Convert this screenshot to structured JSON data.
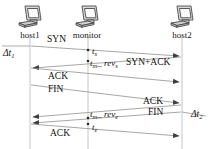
{
  "diagram": {
    "type": "network-sequence-diagram",
    "background_color": "#ffffff",
    "line_color": "#8a8a8a",
    "text_color": "#111111",
    "width": 215,
    "height": 149,
    "nodes": [
      {
        "id": "host1",
        "label": "host1",
        "icon": "computer-icon",
        "x": 10,
        "lifeline_x": 30
      },
      {
        "id": "monitor",
        "label": "monitor",
        "icon": "computer-icon",
        "x": 62,
        "lifeline_x": 88
      },
      {
        "id": "host2",
        "label": "host2",
        "icon": "computer-icon",
        "x": 158,
        "lifeline_x": 182
      }
    ],
    "messages": [
      {
        "id": "m1",
        "label": "SYN",
        "from": "host1",
        "to": "host2",
        "direction": "rtl-start-left",
        "x": 47,
        "y": 39
      },
      {
        "id": "m2",
        "label": "SYN+ACK",
        "from": "host2",
        "to": "host1",
        "direction": "right-to-left",
        "x": 126,
        "y": 60
      },
      {
        "id": "m3",
        "label": "ACK",
        "from": "host1",
        "to": "host2",
        "direction": "left-to-right",
        "x": 48,
        "y": 76
      },
      {
        "id": "m4",
        "label": "FIN",
        "from": "host1",
        "to": "host2",
        "direction": "left-to-right",
        "x": 48,
        "y": 88
      },
      {
        "id": "m5",
        "label": "ACK",
        "from": "host2",
        "to": "host1",
        "direction": "right-to-left",
        "x": 143,
        "y": 99
      },
      {
        "id": "m6",
        "label": "FIN",
        "from": "host2",
        "to": "host1",
        "direction": "right-to-left",
        "x": 148,
        "y": 111
      },
      {
        "id": "m7",
        "label": "ACK",
        "from": "host1",
        "to": "host2",
        "direction": "left-to-right",
        "x": 50,
        "y": 132
      }
    ],
    "timestamps": [
      {
        "id": "ts1",
        "base": "t",
        "sub": "s",
        "rev": false,
        "x": 92,
        "y": 51
      },
      {
        "id": "ts2",
        "base": "t",
        "sub": "m",
        "rev": true,
        "rev_sub": "s",
        "x": 90,
        "y": 63
      },
      {
        "id": "ts3",
        "base": "t",
        "sub": "m",
        "rev": true,
        "rev_sub": "e",
        "x": 90,
        "y": 113
      },
      {
        "id": "ts4",
        "base": "t",
        "sub": "e",
        "rev": false,
        "x": 92,
        "y": 126
      }
    ],
    "intervals": [
      {
        "id": "dt1",
        "label": "Δt",
        "sub": "1",
        "x": 3,
        "y": 51
      },
      {
        "id": "dt2",
        "label": "Δt",
        "sub": "2",
        "x": 191,
        "y": 112
      }
    ],
    "rev_word": "rev"
  }
}
